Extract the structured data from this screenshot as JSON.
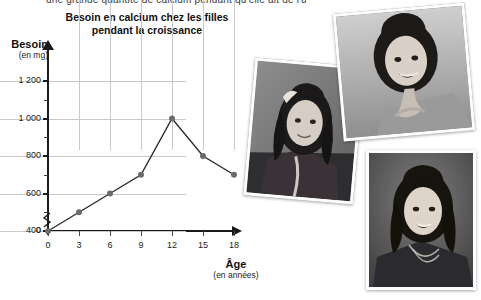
{
  "document": {
    "cut_text": "une grande quantité de calcium pendant qu'elle ait de l'âge"
  },
  "chart_data": {
    "type": "line",
    "title": "Besoin en calcium chez les filles pendant la croissance",
    "title_line1": "Besoin en calcium chez les filles",
    "title_line2": "pendant la croissance",
    "xlabel": "Âge",
    "xlabel_unit": "(en années)",
    "ylabel": "Besoin",
    "ylabel_unit": "(en mg)",
    "x": [
      0,
      3,
      6,
      9,
      12,
      15,
      18
    ],
    "values": [
      400,
      500,
      600,
      700,
      1000,
      800,
      700
    ],
    "categories": [
      "0",
      "3",
      "6",
      "9",
      "12",
      "15",
      "18"
    ],
    "xticklabels": [
      "0",
      "3",
      "6",
      "9",
      "12",
      "15",
      "18"
    ],
    "yticklabels": [
      "0",
      "400",
      "600",
      "800",
      "1 000",
      "1 200"
    ],
    "ytickvalues": [
      0,
      400,
      600,
      800,
      1000,
      1200
    ],
    "yminorticks": [
      500,
      700,
      900,
      1100
    ],
    "xlim": [
      0,
      18
    ],
    "ylim": [
      400,
      1200
    ],
    "grid": true,
    "legend": "none",
    "axis_break": true,
    "origin_label": "0",
    "line_color": "#2b2b2b",
    "marker_color": "#6b6b6b",
    "grid_color": "#c9c9c9",
    "axis_color": "#1a1a1a"
  },
  "photos": [
    {
      "name": "girl-with-pigtails-photo",
      "caption": ""
    },
    {
      "name": "young-girl-smiling-photo",
      "caption": ""
    },
    {
      "name": "teen-girl-portrait-photo",
      "caption": ""
    }
  ]
}
